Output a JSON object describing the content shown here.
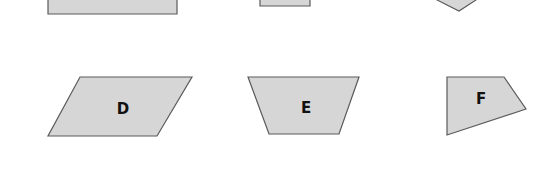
{
  "colors": {
    "fill": "#d6d6d6",
    "stroke": "#5a5a5a",
    "label": "#111111",
    "background": "#ffffff"
  },
  "top_row": [
    {
      "id": "top-left-rectangle",
      "type": "rectangle",
      "label": ""
    },
    {
      "id": "top-middle-rectangle",
      "type": "rectangle",
      "label": ""
    },
    {
      "id": "top-right-pentagon",
      "type": "pentagon",
      "label": ""
    }
  ],
  "shapes": [
    {
      "id": "D",
      "type": "parallelogram",
      "label": "D"
    },
    {
      "id": "E",
      "type": "trapezoid",
      "label": "E"
    },
    {
      "id": "F",
      "type": "quadrilateral",
      "label": "F"
    }
  ]
}
